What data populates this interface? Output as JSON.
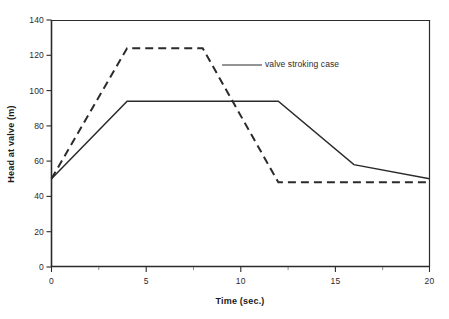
{
  "chart_data": {
    "type": "line",
    "title": "",
    "xlabel": "Time (sec.)",
    "ylabel": "Head at valve (m)",
    "xlim": [
      0,
      20
    ],
    "ylim": [
      0,
      140
    ],
    "xticks": [
      "0",
      "5",
      "10",
      "15",
      "20"
    ],
    "xtick_values": [
      0,
      5,
      10,
      15,
      20
    ],
    "yticks": [
      "0",
      "20",
      "40",
      "60",
      "80",
      "100",
      "120",
      "140"
    ],
    "ytick_values": [
      0,
      20,
      40,
      60,
      80,
      100,
      120,
      140
    ],
    "grid": false,
    "legend_position": "inside-annotation",
    "annotations": [
      {
        "text": "valve stroking case",
        "points_to_series": "valve stroking case",
        "leader_from_x": 12.0,
        "leader_from_y": 114.0,
        "leader_to_x": 11.2,
        "leader_to_y": 114.0
      }
    ],
    "series": [
      {
        "name": "rapid closure case",
        "style": "dashed",
        "color": "#2b2b2b",
        "x": [
          0,
          4,
          8,
          12,
          20
        ],
        "values": [
          50,
          124,
          124,
          48,
          48
        ]
      },
      {
        "name": "valve stroking case",
        "style": "solid",
        "color": "#2b2b2b",
        "x": [
          0,
          4,
          12,
          16,
          20
        ],
        "values": [
          50,
          94,
          94,
          58,
          50
        ]
      }
    ]
  },
  "axis": {
    "x_title": "Time (sec.)",
    "y_title": "Head at valve (m)",
    "x_tick_labels": [
      "0",
      "5",
      "10",
      "15",
      "20"
    ],
    "y_tick_labels": [
      "0",
      "20",
      "40",
      "60",
      "80",
      "100",
      "120",
      "140"
    ]
  },
  "annotation": {
    "text": "valve stroking case"
  },
  "colors": {
    "ink": "#2b2b2b",
    "background": "#ffffff"
  }
}
